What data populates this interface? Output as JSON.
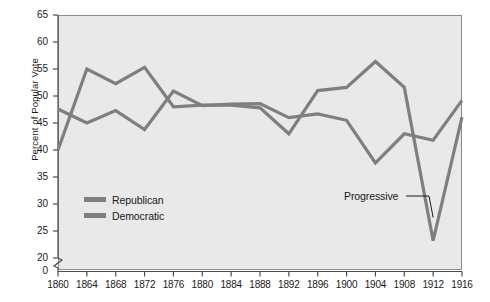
{
  "chart_data": {
    "type": "line",
    "title": "",
    "xlabel": "",
    "ylabel": "Percent of Popular Vote",
    "categories": [
      1860,
      1864,
      1868,
      1872,
      1876,
      1880,
      1884,
      1888,
      1892,
      1896,
      1900,
      1904,
      1908,
      1912,
      1916
    ],
    "xlim": [
      1860,
      1916
    ],
    "ylim": [
      20,
      65
    ],
    "y_axis_break": true,
    "y_axis_origin_label": "0",
    "yticks": [
      20,
      25,
      30,
      35,
      40,
      45,
      50,
      55,
      60,
      65
    ],
    "xticks": [
      "1860",
      "1864",
      "1868",
      "1872",
      "1876",
      "1880",
      "1884",
      "1888",
      "1892",
      "1896",
      "1900",
      "1904",
      "1908",
      "1912",
      "1916"
    ],
    "grid": false,
    "legend_position": "inside-lower-left",
    "series": [
      {
        "name": "Republican",
        "color": "#7f7f7f",
        "values": [
          40.0,
          55.0,
          52.3,
          55.3,
          48.0,
          48.3,
          48.3,
          47.8,
          43.0,
          51.0,
          51.6,
          56.4,
          51.6,
          23.2,
          46.1
        ]
      },
      {
        "name": "Democratic",
        "color": "#7f7f7f",
        "values": [
          47.6,
          45.0,
          47.3,
          43.8,
          50.9,
          48.2,
          48.5,
          48.6,
          46.0,
          46.7,
          45.5,
          37.6,
          43.0,
          41.8,
          49.2
        ]
      }
    ],
    "annotations": [
      {
        "label": "Progressive",
        "points_to_year": 1912,
        "points_to_value": 27.5
      }
    ]
  },
  "legend": {
    "items": [
      {
        "label": "Republican",
        "color": "#7f7f7f"
      },
      {
        "label": "Democratic",
        "color": "#7f7f7f"
      }
    ]
  },
  "colors": {
    "plot_background": "#e9e9e9",
    "line": "#7f7f7f",
    "axis": "#4d4d4d",
    "text": "#1a1a1a",
    "page_background": "#ffffff"
  }
}
